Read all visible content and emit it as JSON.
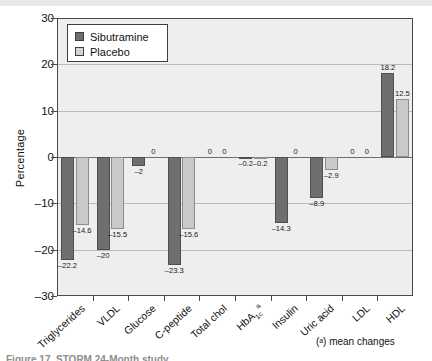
{
  "figure": {
    "footnote": "(ᵃ) mean changes",
    "caption_clipped": "Figure 17. STORM 24-Month study"
  },
  "legend": {
    "position": "top-left-inside",
    "items": [
      {
        "label": "Sibutramine",
        "color": "#6f6f6f"
      },
      {
        "label": "Placebo",
        "color": "#c9c9c9"
      }
    ]
  },
  "axis": {
    "ylabel": "Percentage",
    "yticks": [
      "30",
      "20",
      "10",
      "0",
      "-10",
      "-20",
      "-30"
    ],
    "ymin": -30,
    "ymax": 30
  },
  "chart_data": {
    "type": "bar",
    "title": "",
    "xlabel": "",
    "ylabel": "Percentage",
    "ylim": [
      -30,
      30
    ],
    "yticks": [
      30,
      20,
      10,
      0,
      -10,
      -20,
      -30
    ],
    "grid": true,
    "legend_position": "upper left",
    "categories": [
      "Triglycerides",
      "VLDL",
      "Glucose",
      "C-peptide",
      "Total chol",
      "HbA1c",
      "Insulin",
      "Uric acid",
      "LDL",
      "HDL"
    ],
    "category_labels_display": [
      "Triglycerides",
      "VLDL",
      "Glucose",
      "C-peptide",
      "Total chol",
      "HbA<sub>1c</sub><sup>a</sup>",
      "Insulin",
      "Uric acid",
      "LDL",
      "HDL"
    ],
    "series": [
      {
        "name": "Sibutramine",
        "color": "#6f6f6f",
        "values": [
          -22.2,
          -20,
          -2,
          -23.3,
          0,
          -0.2,
          -14.3,
          -8.9,
          0,
          18.2
        ],
        "value_labels": [
          "-22.2",
          "-20",
          "-2",
          "-23.3",
          "0",
          "-0.2",
          "-14.3",
          "-8.9",
          "0",
          "18.2"
        ]
      },
      {
        "name": "Placebo",
        "color": "#c9c9c9",
        "values": [
          -14.6,
          -15.5,
          0,
          -15.6,
          0,
          -0.2,
          0,
          -2.9,
          0,
          12.5
        ],
        "value_labels": [
          "-14.6",
          "-15.5",
          "0",
          "-15.6",
          "0",
          "-0.2",
          "0",
          "-2.9",
          "0",
          "12.5"
        ]
      }
    ]
  }
}
